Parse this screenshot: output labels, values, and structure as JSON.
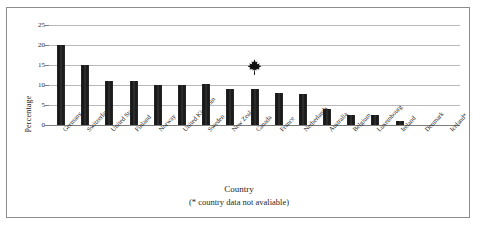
{
  "figure": {
    "frame_border_color": "#8d8d8d",
    "background_color": "#ffffff"
  },
  "axis": {
    "y_title": "Percentage",
    "x_title": "Country",
    "x_note": "(* country data not avaliable)"
  },
  "marker": {
    "name": "maple-leaf-icon",
    "over_category": "Canada",
    "color": "#111111"
  },
  "chart_data": {
    "type": "bar",
    "title": "",
    "subtitle": "",
    "xlabel": "Country",
    "ylabel": "Percentage",
    "annotations": [
      {
        "text": "(* country data not avaliable)",
        "position": "below-xlabel"
      },
      {
        "icon": "maple-leaf",
        "category": "Canada",
        "position": "above-bar",
        "value_y": 14.5
      }
    ],
    "grid": true,
    "legend": "none",
    "ylim": [
      0,
      25
    ],
    "yticks": [
      0,
      5,
      10,
      15,
      20,
      25
    ],
    "ytick_labels": [
      "0",
      "5",
      "10",
      "15",
      "20",
      "25"
    ],
    "bar_color": "#1b1b1b",
    "categories": [
      "Germany",
      "Switzerland",
      "United States",
      "Finland",
      "Norway",
      "United Kingdom",
      "Sweden",
      "New Zealand",
      "Canada",
      "France",
      "Netherlands",
      "Australia",
      "Belgium",
      "Luxembourg",
      "Ireland",
      "Denmark",
      "Iceland*"
    ],
    "values": [
      20,
      15,
      11,
      11,
      10,
      10,
      10.2,
      9,
      9,
      8,
      7.8,
      4,
      2.5,
      2.5,
      1,
      0,
      0
    ]
  }
}
